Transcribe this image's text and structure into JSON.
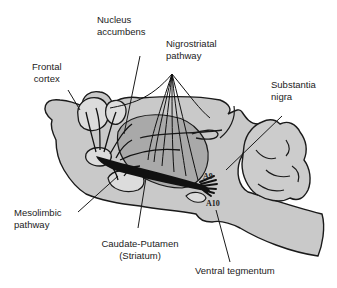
{
  "diagram": {
    "colors": {
      "brain_fill": "#c9c9c9",
      "striatum_fill": "#a9a9a9",
      "outline": "#1a1a1a",
      "pathway": "#111111",
      "background": "#ffffff"
    },
    "labels": {
      "nucleus_accumbens": [
        "Nucleus",
        "accumbens"
      ],
      "nigrostriatal": [
        "Nigrostriatal",
        "pathway"
      ],
      "frontal_cortex": [
        "Frontal",
        "cortex"
      ],
      "substantia_nigra": [
        "Substantia",
        "nigra"
      ],
      "mesolimbic": [
        "Mesolimbic",
        "pathway"
      ],
      "caudate_putamen": [
        "Caudate-Putamen",
        "(Striatum)"
      ],
      "ventral_tegmentum": "Ventral  tegmentum",
      "a9": "A9",
      "a10": "A10"
    }
  }
}
